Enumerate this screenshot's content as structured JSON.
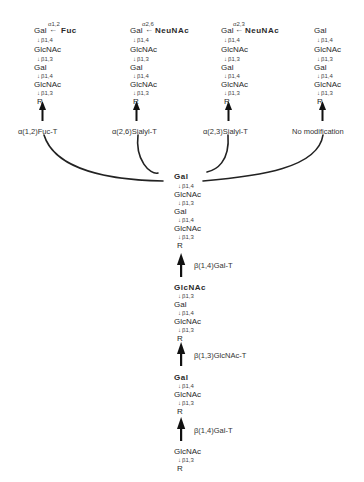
{
  "columns": [
    {
      "top": {
        "sugar": "Gal",
        "arrow": "←",
        "substituent": "Fuc",
        "linkage": "α1,2"
      },
      "chain": [
        {
          "sugar": "Gal"
        },
        {
          "link": "β1,4"
        },
        {
          "sugar": "GlcNAc"
        },
        {
          "link": "β1,3"
        },
        {
          "sugar": "Gal"
        },
        {
          "link": "β1,4"
        },
        {
          "sugar": "GlcNAc"
        },
        {
          "link": "β1,3"
        },
        {
          "sugar": "R"
        }
      ],
      "enzyme": "α(1,2)Fuc-T"
    },
    {
      "top": {
        "sugar": "Gal",
        "arrow": "←",
        "substituent": "NeuNAc",
        "linkage": "α2,6"
      },
      "enzyme": "α(2,6)Sialyl-T"
    },
    {
      "top": {
        "sugar": "Gal",
        "arrow": "←",
        "substituent": "NeuNAc",
        "linkage": "α2,3"
      },
      "enzyme": "α(2,3)Sialyl-T"
    },
    {
      "top": {
        "sugar": "Gal"
      },
      "enzyme": "No modification"
    }
  ],
  "chain_labels": {
    "gal": "Gal",
    "glcnac": "GlcNAc",
    "r": "R",
    "b14": "β1,4",
    "b13": "β1,3",
    "down_arrow": "↓"
  },
  "central": {
    "block1": {
      "top": "Gal",
      "rows": [
        "GlcNAc",
        "Gal",
        "GlcNAc",
        "R"
      ],
      "links": [
        "β1,4",
        "β1,3",
        "β1,4",
        "β1,3"
      ]
    },
    "enzyme1": "β(1,4)Gal-T",
    "block2": {
      "top": "GlcNAc",
      "rows": [
        "Gal",
        "GlcNAc",
        "R"
      ],
      "links": [
        "β1,3",
        "β1,4",
        "β1,3"
      ]
    },
    "enzyme2": "β(1,3)GlcNAc-T",
    "block3": {
      "top": "Gal",
      "rows": [
        "GlcNAc",
        "R"
      ],
      "links": [
        "β1,4",
        "β1,3"
      ]
    },
    "enzyme3": "β(1,4)Gal-T",
    "block4": {
      "top": "GlcNAc",
      "rows": [
        "R"
      ],
      "links": [
        "β1,3"
      ]
    }
  }
}
